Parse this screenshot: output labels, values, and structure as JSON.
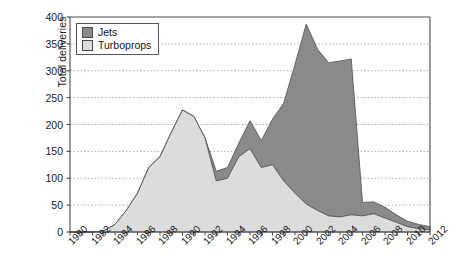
{
  "chart_data": {
    "type": "area",
    "stacked": true,
    "title": "",
    "xlabel": "",
    "ylabel": "Total deliveries",
    "ylim": [
      0,
      400
    ],
    "ytick_step": 50,
    "ytick_labels": [
      "0",
      "50",
      "100",
      "150",
      "200",
      "250",
      "300",
      "350",
      "400"
    ],
    "xlim": [
      1980,
      2012
    ],
    "xtick_step": 2,
    "xtick_labels": [
      "1980",
      "1982",
      "1984",
      "1986",
      "1988",
      "1990",
      "1992",
      "1994",
      "1996",
      "1998",
      "2000",
      "2002",
      "2004",
      "2006",
      "2008",
      "2010",
      "2012"
    ],
    "x": [
      1980,
      1981,
      1982,
      1983,
      1984,
      1985,
      1986,
      1987,
      1988,
      1989,
      1990,
      1991,
      1992,
      1993,
      1994,
      1995,
      1996,
      1997,
      1998,
      1999,
      2000,
      2001,
      2002,
      2003,
      2004,
      2005,
      2006,
      2007,
      2008,
      2009,
      2010,
      2011,
      2012
    ],
    "grid": "horizontal-dotted",
    "legend_position": "top-left",
    "series": [
      {
        "name": "Turboprops",
        "color": "#dcdcdc",
        "values": [
          0,
          0,
          0,
          2,
          14,
          40,
          72,
          120,
          140,
          185,
          227,
          215,
          175,
          95,
          100,
          140,
          155,
          120,
          125,
          95,
          72,
          52,
          40,
          30,
          28,
          32,
          30,
          34,
          26,
          18,
          10,
          6,
          4
        ]
      },
      {
        "name": "Jets",
        "color": "#8a8a8a",
        "values": [
          0,
          0,
          0,
          0,
          0,
          0,
          0,
          0,
          0,
          0,
          0,
          0,
          0,
          18,
          20,
          25,
          52,
          50,
          85,
          145,
          240,
          335,
          300,
          285,
          290,
          290,
          25,
          22,
          20,
          14,
          10,
          8,
          6
        ]
      }
    ],
    "totals_note": "Jets values are the incremental band stacked above Turboprops"
  },
  "legend": {
    "items": [
      {
        "label": "Jets",
        "color": "#8a8a8a"
      },
      {
        "label": "Turboprops",
        "color": "#dcdcdc"
      }
    ]
  },
  "axes": {
    "y_title": "Total deliveries"
  }
}
